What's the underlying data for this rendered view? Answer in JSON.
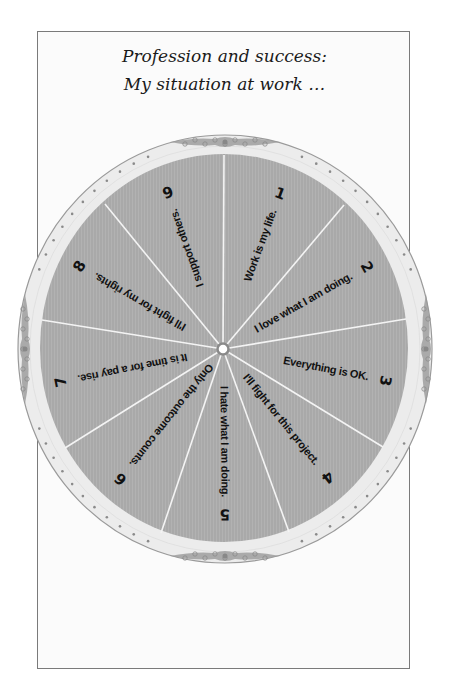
{
  "title": {
    "line1": "Profession and success:",
    "line2": "My situation at work …"
  },
  "wheel": {
    "center": {
      "x": 223,
      "y": 349
    },
    "outer_ring": {
      "rx": 207,
      "ry": 214,
      "color": "#ececec",
      "border": "#9a9a9a",
      "dot_color": "#8a8a8a"
    },
    "disc": {
      "rx": 184,
      "ry": 194,
      "color": "#a9a9a9"
    },
    "divider_color": "#f4f4f4",
    "dividers": [
      {
        "x": 224,
        "y": 155
      },
      {
        "x": 344,
        "y": 205
      },
      {
        "x": 406,
        "y": 319
      },
      {
        "x": 383,
        "y": 447
      },
      {
        "x": 289,
        "y": 532
      },
      {
        "x": 161,
        "y": 533
      },
      {
        "x": 65,
        "y": 448
      },
      {
        "x": 42,
        "y": 320
      },
      {
        "x": 105,
        "y": 204
      }
    ],
    "segments": [
      {
        "number": "1",
        "label": "Work is my life."
      },
      {
        "number": "2",
        "label": "I love what I am doing."
      },
      {
        "number": "3",
        "label": "Everything is OK."
      },
      {
        "number": "4",
        "label": "I'll fight for this project."
      },
      {
        "number": "5",
        "label": "I hate what I am doing."
      },
      {
        "number": "6",
        "label": "Only the outcome counts."
      },
      {
        "number": "7",
        "label": "It is time for a pay rise."
      },
      {
        "number": "8",
        "label": "I'll fight for my rights."
      },
      {
        "number": "9",
        "label": "I support others."
      }
    ]
  }
}
